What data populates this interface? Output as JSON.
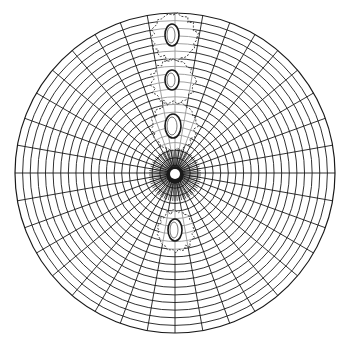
{
  "figure": {
    "colors": {
      "background": "#ffffff",
      "ink": "#1a1a1a",
      "dashed": "#333333"
    },
    "grid": {
      "center": [
        175,
        173
      ],
      "radius": 160,
      "ring_count": 21,
      "spoke_count": 36
    },
    "center_spot": {
      "cx": 175,
      "cy": 175,
      "outer_r": 9,
      "inner_r": 5
    },
    "ovals": [
      {
        "label": "oval-1",
        "cx": 172,
        "cy": 35,
        "rx": 7,
        "ry": 11,
        "halo": {
          "cx": 174,
          "cy": 37,
          "rx": 22,
          "ry": 23
        }
      },
      {
        "label": "oval-2",
        "cx": 172,
        "cy": 80,
        "rx": 7,
        "ry": 10,
        "halo": {
          "cx": 173,
          "cy": 82,
          "rx": 21,
          "ry": 22
        }
      },
      {
        "label": "oval-3",
        "cx": 173,
        "cy": 126,
        "rx": 8,
        "ry": 12,
        "halo": {
          "cx": 174,
          "cy": 126,
          "rx": 22,
          "ry": 24
        }
      },
      {
        "label": "oval-4",
        "cx": 175,
        "cy": 230,
        "rx": 7,
        "ry": 11,
        "halo": {
          "cx": 176,
          "cy": 231,
          "rx": 18,
          "ry": 20
        }
      }
    ]
  }
}
